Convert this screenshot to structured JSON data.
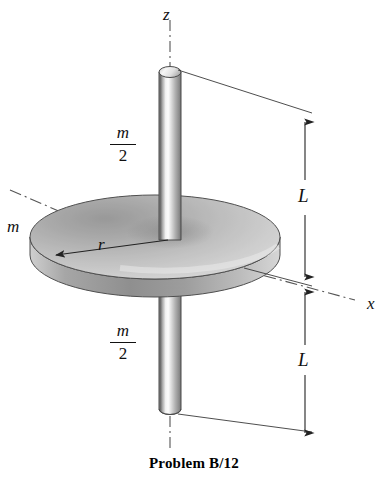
{
  "figure": {
    "caption": "Problem B/12",
    "background_color": "#ffffff",
    "ink_color": "#111111",
    "axes": [
      {
        "id": "z",
        "label": "z",
        "orientation": "vertical",
        "line_style": "dash-dot"
      },
      {
        "id": "x",
        "label": "x",
        "orientation": "oblique-lower-right",
        "line_style": "dash-dot"
      },
      {
        "id": "y",
        "label": "",
        "orientation": "oblique-upper-left",
        "line_style": "dash-dot"
      }
    ],
    "bodies": [
      {
        "id": "upper-rod",
        "kind": "slender-rod",
        "mass_label_numerator": "m",
        "mass_label_denominator": "2",
        "length_label": "L"
      },
      {
        "id": "disk",
        "kind": "circular-disk",
        "mass_label": "m",
        "radius_label": "r"
      },
      {
        "id": "lower-rod",
        "kind": "slender-rod",
        "mass_label_numerator": "m",
        "mass_label_denominator": "2",
        "length_label": "L"
      }
    ],
    "labels": {
      "axis_z": "z",
      "axis_x": "x",
      "disk_mass": "m",
      "disk_radius": "r",
      "upper_rod_mass_num": "m",
      "upper_rod_mass_den": "2",
      "lower_rod_mass_num": "m",
      "lower_rod_mass_den": "2",
      "upper_length": "L",
      "lower_length": "L"
    },
    "colors": {
      "rod_dark": "#6f6f6f",
      "rod_highlight": "#fbfbfb",
      "rod_mid": "#b9b9b9",
      "disk_top_light": "#e4e4e4",
      "disk_top_dark": "#8d8d8d",
      "disk_rim": "#9a9a9a",
      "outline": "#3d3d3d"
    }
  }
}
